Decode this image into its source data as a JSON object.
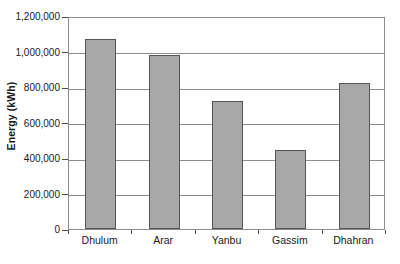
{
  "chart_data": {
    "type": "bar",
    "title": "",
    "xlabel": "",
    "ylabel": "Energy (kWh)",
    "categories": [
      "Dhulum",
      "Arar",
      "Yanbu",
      "Gassim",
      "Dhahran"
    ],
    "values": [
      1070000,
      980000,
      720000,
      445000,
      820000
    ],
    "ylim": [
      0,
      1200000
    ],
    "ytick_values": [
      0,
      200000,
      400000,
      600000,
      800000,
      1000000,
      1200000
    ],
    "ytick_labels": [
      "0",
      "200,000",
      "400,000",
      "600,000",
      "800,000",
      "1,000,000",
      "1,200,000"
    ],
    "grid": true,
    "legend": false,
    "bar_color": "#a8a8a8",
    "bar_edge_color": "#555555",
    "axis_color": "#8c8c8c",
    "series": [
      {
        "name": "Energy",
        "values": [
          1070000,
          980000,
          720000,
          445000,
          820000
        ]
      }
    ]
  }
}
